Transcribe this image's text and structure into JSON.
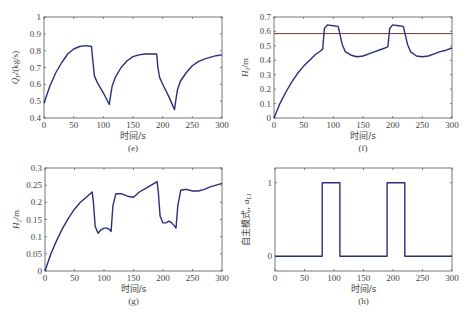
{
  "figure": {
    "caption": "",
    "line_color": "#2a2f7a",
    "ref_line_color": "#6b3a3a"
  },
  "chart_data": [
    {
      "id": "e",
      "type": "line",
      "sublabel": "(e)",
      "xlabel": "时间/s",
      "ylabel": "Q_P/(kg/s)",
      "ylabel_main": "Q",
      "ylabel_sub": "P",
      "ylabel_rest": "/(kg/s)",
      "xlim": [
        0,
        300
      ],
      "ylim": [
        0.4,
        1.0
      ],
      "xticks": [
        0,
        50,
        100,
        150,
        200,
        250,
        300
      ],
      "yticks": [
        0.4,
        0.5,
        0.6,
        0.7,
        0.8,
        0.9,
        1.0
      ],
      "ytick_labels": [
        "0.4",
        "0.5",
        "0.6",
        "0.7",
        "0.8",
        "0.9",
        "1"
      ],
      "grid": false,
      "series": [
        {
          "name": "Q_P",
          "x": [
            0,
            5,
            10,
            20,
            30,
            40,
            50,
            60,
            70,
            80,
            82,
            85,
            90,
            100,
            110,
            112,
            115,
            120,
            130,
            140,
            150,
            160,
            170,
            180,
            190,
            192,
            195,
            200,
            210,
            220,
            222,
            225,
            230,
            240,
            250,
            260,
            270,
            280,
            290,
            300
          ],
          "y": [
            0.49,
            0.54,
            0.59,
            0.67,
            0.73,
            0.78,
            0.81,
            0.825,
            0.83,
            0.825,
            0.75,
            0.65,
            0.61,
            0.55,
            0.48,
            0.53,
            0.59,
            0.64,
            0.7,
            0.74,
            0.765,
            0.775,
            0.78,
            0.78,
            0.78,
            0.7,
            0.64,
            0.6,
            0.53,
            0.45,
            0.5,
            0.57,
            0.62,
            0.67,
            0.71,
            0.735,
            0.75,
            0.76,
            0.77,
            0.775
          ]
        }
      ]
    },
    {
      "id": "f",
      "type": "line",
      "sublabel": "(f)",
      "xlabel": "时间/s",
      "ylabel": "H_1/m",
      "ylabel_main": "H",
      "ylabel_sub": "1",
      "ylabel_rest": "/m",
      "xlim": [
        0,
        300
      ],
      "ylim": [
        0,
        0.7
      ],
      "xticks": [
        0,
        50,
        100,
        150,
        200,
        250,
        300
      ],
      "yticks": [
        0,
        0.1,
        0.2,
        0.3,
        0.4,
        0.5,
        0.6,
        0.7
      ],
      "ytick_labels": [
        "0",
        "0.1",
        "0.2",
        "0.3",
        "0.4",
        "0.5",
        "0.6",
        "0.7"
      ],
      "grid": false,
      "reference_line": {
        "y": 0.585
      },
      "series": [
        {
          "name": "H_1",
          "x": [
            0,
            10,
            20,
            30,
            40,
            50,
            60,
            70,
            80,
            82,
            85,
            90,
            100,
            108,
            110,
            115,
            120,
            130,
            140,
            150,
            160,
            170,
            180,
            190,
            192,
            195,
            200,
            210,
            218,
            220,
            225,
            230,
            240,
            250,
            260,
            270,
            280,
            290,
            300
          ],
          "y": [
            0,
            0.1,
            0.18,
            0.25,
            0.31,
            0.36,
            0.4,
            0.44,
            0.47,
            0.48,
            0.62,
            0.645,
            0.64,
            0.635,
            0.6,
            0.51,
            0.46,
            0.435,
            0.425,
            0.43,
            0.445,
            0.46,
            0.475,
            0.49,
            0.495,
            0.62,
            0.645,
            0.64,
            0.635,
            0.6,
            0.51,
            0.46,
            0.43,
            0.425,
            0.43,
            0.445,
            0.46,
            0.47,
            0.485
          ]
        }
      ]
    },
    {
      "id": "g",
      "type": "line",
      "sublabel": "(g)",
      "xlabel": "时间/s",
      "ylabel": "H_2/m",
      "ylabel_main": "H",
      "ylabel_sub": "2",
      "ylabel_rest": "/m",
      "xlim": [
        0,
        300
      ],
      "ylim": [
        0,
        0.3
      ],
      "xticks": [
        0,
        50,
        100,
        150,
        200,
        250,
        300
      ],
      "yticks": [
        0,
        0.05,
        0.1,
        0.15,
        0.2,
        0.25,
        0.3
      ],
      "ytick_labels": [
        "0",
        "0.05",
        "0.1",
        "0.15",
        "0.2",
        "0.25",
        "0.3"
      ],
      "grid": false,
      "series": [
        {
          "name": "H_2",
          "x": [
            0,
            10,
            20,
            30,
            40,
            50,
            60,
            70,
            80,
            82,
            85,
            90,
            95,
            100,
            105,
            110,
            112,
            115,
            120,
            130,
            140,
            150,
            160,
            170,
            180,
            190,
            192,
            195,
            200,
            205,
            210,
            215,
            220,
            222,
            225,
            230,
            240,
            250,
            260,
            270,
            280,
            290,
            300
          ],
          "y": [
            0,
            0.05,
            0.09,
            0.125,
            0.155,
            0.18,
            0.2,
            0.215,
            0.23,
            0.2,
            0.13,
            0.11,
            0.12,
            0.125,
            0.125,
            0.12,
            0.115,
            0.19,
            0.225,
            0.225,
            0.218,
            0.215,
            0.23,
            0.24,
            0.25,
            0.26,
            0.23,
            0.16,
            0.14,
            0.14,
            0.145,
            0.14,
            0.13,
            0.125,
            0.19,
            0.235,
            0.238,
            0.233,
            0.233,
            0.238,
            0.245,
            0.25,
            0.255
          ]
        }
      ]
    },
    {
      "id": "h",
      "type": "line",
      "sublabel": "(h)",
      "xlabel": "时间/s",
      "ylabel": "自主模式, a_L1",
      "ylabel_main": "自主模式, ",
      "ylabel_sub": "L1",
      "ylabel_rest": "a",
      "xlim": [
        0,
        300
      ],
      "ylim": [
        -0.2,
        1.2
      ],
      "xticks": [
        0,
        50,
        100,
        150,
        200,
        250,
        300
      ],
      "yticks": [
        0,
        1
      ],
      "ytick_labels": [
        "0",
        "1"
      ],
      "grid": false,
      "series": [
        {
          "name": "a_L1",
          "x": [
            0,
            80,
            80,
            110,
            110,
            190,
            190,
            220,
            220,
            300
          ],
          "y": [
            0,
            0,
            1,
            1,
            0,
            0,
            1,
            1,
            0,
            0
          ]
        }
      ]
    }
  ]
}
